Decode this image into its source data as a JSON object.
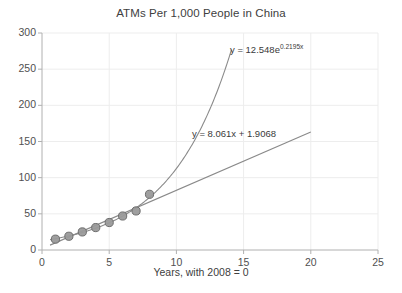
{
  "chart_data": {
    "type": "scatter",
    "title": "ATMs Per 1,000 People in China",
    "xlabel": "Years, with 2008 = 0",
    "ylabel": "",
    "xlim": [
      0,
      25
    ],
    "ylim": [
      0,
      300
    ],
    "grid": true,
    "legend": "none",
    "x_ticks": [
      "0",
      "5",
      "10",
      "15",
      "20",
      "25"
    ],
    "y_ticks": [
      "0",
      "50",
      "100",
      "150",
      "200",
      "250",
      "300"
    ],
    "x": [
      1,
      2,
      3,
      4,
      5,
      6,
      7,
      8
    ],
    "values": [
      15,
      19,
      25,
      31,
      38,
      47,
      54,
      77
    ],
    "series": [
      {
        "name": "ATMs per 1,000 people",
        "x": [
          1,
          2,
          3,
          4,
          5,
          6,
          7,
          8
        ],
        "values": [
          15,
          19,
          25,
          31,
          38,
          47,
          54,
          77
        ]
      }
    ],
    "trendlines": [
      {
        "name": "exponential-trendline",
        "kind": "exponential",
        "equation": "y = 12.548e",
        "equation_exponent": "0.2195x",
        "coefficient": 12.548,
        "rate": 0.2195,
        "x_start": 0.6,
        "x_end": 14.1
      },
      {
        "name": "linear-trendline",
        "kind": "linear",
        "equation": "y = 8.061x + 1.9068",
        "slope": 8.061,
        "intercept": 1.9068,
        "x_start": 0.6,
        "x_end": 20.0
      }
    ],
    "colors": {
      "marker_fill": "#9a9a9a",
      "marker_edge": "#6e6e6e",
      "trendline": "#8a8a8a",
      "axis": "#b0b0b0",
      "gridline": "#ededed",
      "text": "#404040",
      "background": "#ffffff"
    }
  }
}
